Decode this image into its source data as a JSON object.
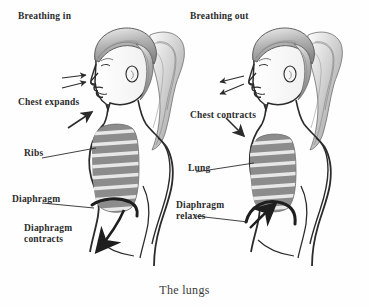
{
  "illustration": {
    "title": "The lungs",
    "caption": "The lungs",
    "background_color": "#fefefe",
    "ink_color": "#2b2b2b",
    "lung_fill_color": "#8c8c8c",
    "rib_stripe_color": "#e8e8e8",
    "hair_color": "#9a9a9a"
  },
  "figures": [
    {
      "id": "left-figure",
      "name": "breathing-in-figure",
      "state": "inhale",
      "description": "Side profile of a woman with a ponytail facing left, chest expanded"
    },
    {
      "id": "right-figure",
      "name": "breathing-out-figure",
      "state": "exhale",
      "description": "Side profile of a woman with a ponytail facing left, chest contracted"
    }
  ],
  "labels": {
    "breathing_in": "Breathing in",
    "chest_expands": "Chest expands",
    "ribs": "Ribs",
    "diaphragm": "Diaphragm",
    "diaphragm_contracts": "Diaphragm\ncontracts",
    "breathing_out": "Breathing out",
    "chest_contracts": "Chest contracts",
    "lung": "Lung",
    "diaphragm_relaxes": "Diaphragm\nrelaxes"
  },
  "arrows": {
    "air_in": "two thin arrows pointing toward the nose",
    "air_out": "two thin arrows pointing away from the nose",
    "chest_expands_arrow": "arrow pointing up-right toward the chest",
    "chest_contracts_arrow": "arrow pointing down-right toward the chest",
    "diaphragm_down_arrow": "thick arrow pointing down and left",
    "diaphragm_up_arrow": "thick arrow pointing up and right"
  }
}
